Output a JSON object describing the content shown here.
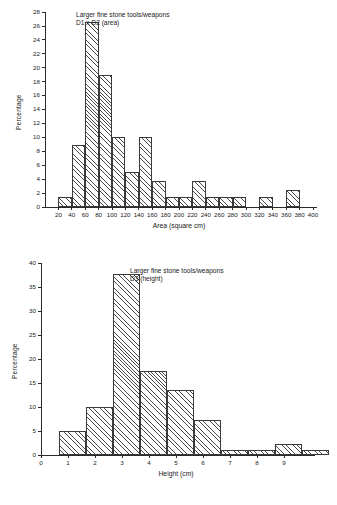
{
  "figure": {
    "background": "#ffffff",
    "ink": "#1a1a1a",
    "bar_edge": "#3a3a3a",
    "hatch_color": "#4a4a4a"
  },
  "chart_data": [
    {
      "type": "bar",
      "id": "area-histogram",
      "title": "",
      "annotation_line1": "Larger fine stone tools/weapons",
      "annotation_line2": "D1 x D2 (area)",
      "xlabel": "Area (square cm)",
      "ylabel": "Percentage",
      "xlim": [
        0,
        400
      ],
      "ylim": [
        0,
        28
      ],
      "ytick_step": 2,
      "xtick_step": 20,
      "grid": false,
      "legend": "none",
      "xticks": [
        20,
        40,
        60,
        80,
        100,
        120,
        140,
        160,
        180,
        200,
        220,
        240,
        260,
        280,
        300,
        320,
        340,
        360,
        380,
        400
      ],
      "yticks": [
        0,
        2,
        4,
        6,
        8,
        10,
        12,
        14,
        16,
        18,
        20,
        22,
        24,
        26,
        28
      ],
      "bin_edges": [
        20,
        40,
        60,
        80,
        100,
        120,
        140,
        160,
        180,
        200,
        220,
        240,
        260,
        280,
        300,
        320,
        340,
        360,
        380
      ],
      "bin_labels": [
        "20-40",
        "40-60",
        "60-80",
        "80-100",
        "100-120",
        "120-140",
        "140-160",
        "160-180",
        "180-200",
        "200-220",
        "220-240",
        "240-260",
        "260-280",
        "280-300",
        "300-320",
        "320-340",
        "340-360",
        "360-380"
      ],
      "values": [
        1.4,
        8.9,
        26.6,
        19.0,
        10.1,
        5.0,
        10.1,
        3.8,
        1.4,
        1.4,
        3.8,
        1.4,
        1.4,
        1.4,
        0,
        1.4,
        0,
        2.5
      ]
    },
    {
      "type": "bar",
      "id": "height-histogram",
      "title": "",
      "annotation_line1": "Larger fine stone tools/weapons",
      "annotation_line2": "D3 (height)",
      "xlabel": "Height (cm)",
      "ylabel": "Percentage",
      "xlim": [
        0,
        10
      ],
      "ylim": [
        0,
        40
      ],
      "ytick_step": 5,
      "xtick_step": 1,
      "grid": false,
      "legend": "none",
      "xticks": [
        0,
        1,
        2,
        3,
        4,
        5,
        6,
        7,
        8,
        9
      ],
      "yticks": [
        0,
        5,
        10,
        15,
        20,
        25,
        30,
        35,
        40
      ],
      "bin_edges": [
        0.65,
        1.65,
        2.65,
        3.65,
        4.65,
        5.65,
        6.65,
        7.65,
        8.65,
        9.65
      ],
      "bin_labels": [
        "1",
        "2",
        "3",
        "4",
        "5",
        "6",
        "7",
        "8",
        "9",
        "10"
      ],
      "values": [
        4.9,
        10.0,
        37.8,
        17.4,
        13.6,
        7.2,
        1.0,
        1.0,
        2.2,
        1.0
      ]
    }
  ]
}
